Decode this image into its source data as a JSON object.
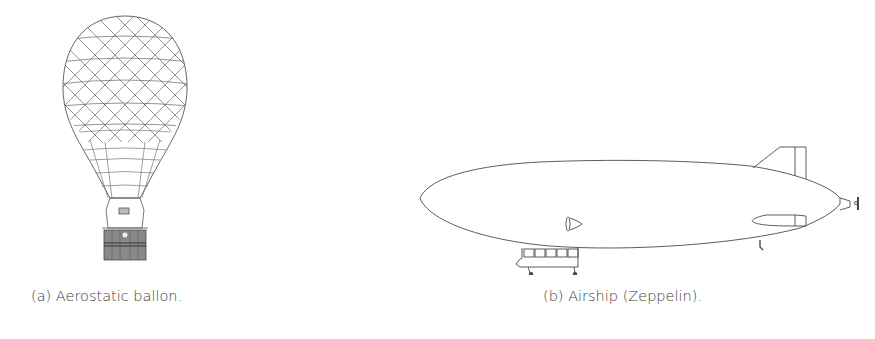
{
  "figure": {
    "subfigures": [
      {
        "label": "(a)",
        "caption": "Aerostatic ballon.",
        "illustration": "hot-air-balloon-line-drawing"
      },
      {
        "label": "(b)",
        "caption": "Airship (Zeppelin).",
        "illustration": "zeppelin-airship-line-drawing"
      }
    ]
  },
  "colors": {
    "line": "#4a4a4a",
    "basket": "#6e6e6e",
    "background": "#ffffff",
    "caption_text": "#3c3c3c"
  }
}
